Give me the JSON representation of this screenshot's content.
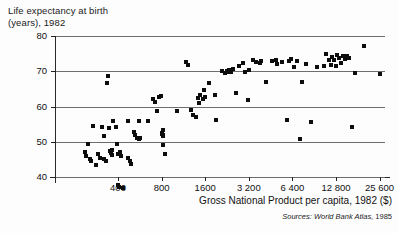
{
  "figure": {
    "y_axis_title": "Life expectancy at birth\n(years), 1982",
    "x_axis_title": "Gross National Product per capita, 1982 ($)",
    "source_prefix": "Sources: World Bank Atlas,",
    "source_year": "1985"
  },
  "chart_data": {
    "type": "scatter",
    "title": "",
    "ylabel": "Life expectancy at birth (years), 1982",
    "xlabel": "Gross National Product per capita, 1982 ($)",
    "xscale": "log2",
    "xlim": [
      200,
      36000
    ],
    "ylim": [
      34,
      80
    ],
    "ytick_labels": [
      "80",
      "70",
      "60",
      "50",
      "40"
    ],
    "ytick_values": [
      80,
      70,
      60,
      50,
      40
    ],
    "xtick_labels": [
      "400",
      "800",
      "1600",
      "3 200",
      "6 400",
      "12 800",
      "25 600"
    ],
    "xtick_values": [
      400,
      800,
      1600,
      3200,
      6400,
      12800,
      25600
    ],
    "grid": "horizontal",
    "legend": "none",
    "marker": "filled-square",
    "n_points": 118,
    "points": [
      [
        237,
        47
      ],
      [
        240,
        46
      ],
      [
        249,
        49.5
      ],
      [
        258,
        45
      ],
      [
        262,
        44.5
      ],
      [
        270,
        54.5
      ],
      [
        283,
        43.5
      ],
      [
        292,
        46.5
      ],
      [
        299,
        45.5
      ],
      [
        312,
        54.2
      ],
      [
        318,
        51.5
      ],
      [
        322,
        45.0
      ],
      [
        330,
        44.4
      ],
      [
        336,
        66.6
      ],
      [
        340,
        68.6
      ],
      [
        345,
        53.8
      ],
      [
        352,
        47.5
      ],
      [
        358,
        46.9
      ],
      [
        362,
        47.8
      ],
      [
        366,
        46.2
      ],
      [
        372,
        55.8
      ],
      [
        385,
        54.3
      ],
      [
        392,
        49.4
      ],
      [
        398,
        46.5
      ],
      [
        402,
        37.6
      ],
      [
        408,
        37.2
      ],
      [
        416,
        47.1
      ],
      [
        422,
        46.0
      ],
      [
        436,
        36.8
      ],
      [
        470,
        45.4
      ],
      [
        486,
        44.6
      ],
      [
        494,
        43.8
      ],
      [
        512,
        52.9
      ],
      [
        528,
        52.0
      ],
      [
        545,
        51.0
      ],
      [
        560,
        50.9
      ],
      [
        572,
        51.1
      ],
      [
        640,
        55.9
      ],
      [
        700,
        62.2
      ],
      [
        716,
        61.3
      ],
      [
        742,
        58.6
      ],
      [
        770,
        62.8
      ],
      [
        790,
        63.0
      ],
      [
        800,
        52.5
      ],
      [
        808,
        52.1
      ],
      [
        812,
        51.5
      ],
      [
        816,
        53.4
      ],
      [
        820,
        51.8
      ],
      [
        824,
        49.1
      ],
      [
        848,
        46.4
      ],
      [
        1180,
        72.6
      ],
      [
        1220,
        71.8
      ],
      [
        1280,
        59.0
      ],
      [
        1310,
        57.7
      ],
      [
        1380,
        56.9
      ],
      [
        1420,
        62.5
      ],
      [
        1450,
        61.0
      ],
      [
        1480,
        63.2
      ],
      [
        1540,
        62.0
      ],
      [
        1580,
        64.8
      ],
      [
        1600,
        62.6
      ],
      [
        1700,
        66.7
      ],
      [
        1860,
        63.4
      ],
      [
        1900,
        56.1
      ],
      [
        2100,
        70.2
      ],
      [
        2200,
        69.6
      ],
      [
        2260,
        70.1
      ],
      [
        2300,
        69.8
      ],
      [
        2340,
        70.3
      ],
      [
        2400,
        69.9
      ],
      [
        2500,
        70.5
      ],
      [
        2600,
        63.9
      ],
      [
        2740,
        71.6
      ],
      [
        2900,
        72.2
      ],
      [
        3000,
        69.9
      ],
      [
        3150,
        61.9
      ],
      [
        3220,
        70.3
      ],
      [
        3400,
        73.2
      ],
      [
        3600,
        72.5
      ],
      [
        3900,
        73.0
      ],
      [
        4200,
        66.9
      ],
      [
        4600,
        72.8
      ],
      [
        5000,
        72.0
      ],
      [
        5400,
        72.6
      ],
      [
        5900,
        56.2
      ],
      [
        6300,
        73.5
      ],
      [
        6600,
        71.3
      ],
      [
        6900,
        72.9
      ],
      [
        7200,
        50.9
      ],
      [
        7500,
        67.0
      ],
      [
        8000,
        72.1
      ],
      [
        8600,
        55.7
      ],
      [
        9400,
        71.3
      ],
      [
        10600,
        71.6
      ],
      [
        11000,
        74.8
      ],
      [
        11400,
        73.1
      ],
      [
        11800,
        71.9
      ],
      [
        12100,
        74.1
      ],
      [
        12400,
        73.3
      ],
      [
        12700,
        71.5
      ],
      [
        13000,
        74.6
      ],
      [
        13400,
        73.8
      ],
      [
        13900,
        72.2
      ],
      [
        14300,
        74.2
      ],
      [
        14800,
        73.6
      ],
      [
        15200,
        74.4
      ],
      [
        15800,
        73.9
      ],
      [
        16400,
        54.3
      ],
      [
        17200,
        69.4
      ],
      [
        20000,
        77.3
      ],
      [
        25600,
        69.2
      ],
      [
        560,
        56.0
      ],
      [
        470,
        55.8
      ],
      [
        1020,
        58.8
      ],
      [
        4950,
        73.1
      ],
      [
        6100,
        72.8
      ],
      [
        3800,
        72.4
      ]
    ]
  }
}
